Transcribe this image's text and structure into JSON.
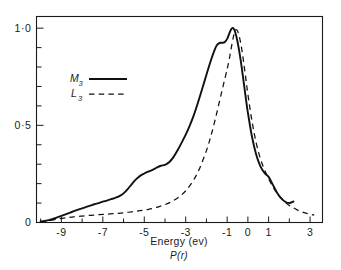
{
  "chart_data": {
    "type": "line",
    "title": "",
    "xlabel": "Energy (ev)",
    "ylabel": "",
    "xlim": [
      -10.2,
      3.6
    ],
    "ylim": [
      0,
      1.06
    ],
    "grid": false,
    "legend_position": "upper-left-inside",
    "x_tick_labels": [
      "-9",
      "-7",
      "-5",
      "-3",
      "-1",
      "0",
      "1",
      "3"
    ],
    "x_tick_values": [
      -9,
      -7,
      -5,
      -3,
      -1,
      0,
      1,
      3
    ],
    "x_minor_ticks": [
      -10,
      -9,
      -8,
      -7,
      -6,
      -5,
      -4,
      -3,
      -2,
      -1,
      0,
      1,
      2,
      3
    ],
    "y_tick_labels": [
      "0",
      "0·5",
      "1·0"
    ],
    "y_tick_values": [
      0,
      0.5,
      1.0
    ],
    "y_minor_ticks": [
      0,
      0.1,
      0.2,
      0.3,
      0.4,
      0.5,
      0.6,
      0.7,
      0.8,
      0.9,
      1.0
    ],
    "caption": "P(r)",
    "series": [
      {
        "name": "M3",
        "label": "M",
        "label_sub": "3",
        "style": "solid",
        "color": "#111111",
        "x": [
          -10.0,
          -9.8,
          -9.6,
          -9.4,
          -9.2,
          -9.0,
          -8.8,
          -8.6,
          -8.4,
          -8.2,
          -8.0,
          -7.8,
          -7.6,
          -7.4,
          -7.2,
          -7.0,
          -6.8,
          -6.6,
          -6.4,
          -6.2,
          -6.0,
          -5.8,
          -5.6,
          -5.4,
          -5.2,
          -5.0,
          -4.8,
          -4.6,
          -4.4,
          -4.2,
          -4.0,
          -3.8,
          -3.6,
          -3.4,
          -3.2,
          -3.0,
          -2.8,
          -2.6,
          -2.4,
          -2.2,
          -2.0,
          -1.8,
          -1.6,
          -1.5,
          -1.4,
          -1.3,
          -1.2,
          -1.1,
          -1.0,
          -0.9,
          -0.8,
          -0.7,
          -0.6,
          -0.5,
          -0.4,
          -0.3,
          -0.2,
          -0.1,
          0.0,
          0.2,
          0.4,
          0.6,
          0.8,
          1.0,
          1.2,
          1.4,
          1.6,
          1.8,
          2.0,
          2.2
        ],
        "y": [
          0.005,
          0.008,
          0.012,
          0.018,
          0.026,
          0.034,
          0.042,
          0.05,
          0.058,
          0.066,
          0.073,
          0.08,
          0.087,
          0.094,
          0.1,
          0.107,
          0.113,
          0.12,
          0.127,
          0.136,
          0.15,
          0.172,
          0.198,
          0.222,
          0.24,
          0.252,
          0.262,
          0.271,
          0.282,
          0.292,
          0.297,
          0.31,
          0.335,
          0.37,
          0.41,
          0.452,
          0.5,
          0.555,
          0.62,
          0.69,
          0.76,
          0.83,
          0.89,
          0.912,
          0.922,
          0.925,
          0.925,
          0.93,
          0.945,
          0.972,
          0.995,
          1.0,
          0.975,
          0.93,
          0.87,
          0.8,
          0.72,
          0.64,
          0.565,
          0.44,
          0.35,
          0.29,
          0.255,
          0.235,
          0.195,
          0.155,
          0.125,
          0.107,
          0.1,
          0.108
        ]
      },
      {
        "name": "L3",
        "label": "L",
        "label_sub": "3",
        "style": "dashed",
        "color": "#111111",
        "x": [
          -10.0,
          -9.6,
          -9.2,
          -8.8,
          -8.4,
          -8.0,
          -7.6,
          -7.2,
          -6.8,
          -6.4,
          -6.0,
          -5.6,
          -5.2,
          -4.8,
          -4.4,
          -4.0,
          -3.6,
          -3.2,
          -2.8,
          -2.4,
          -2.0,
          -1.8,
          -1.6,
          -1.4,
          -1.2,
          -1.0,
          -0.9,
          -0.8,
          -0.7,
          -0.6,
          -0.5,
          -0.4,
          -0.3,
          -0.2,
          -0.1,
          0.0,
          0.2,
          0.4,
          0.6,
          0.8,
          1.0,
          1.2,
          1.4,
          1.6,
          1.8,
          2.0,
          2.2,
          2.4,
          2.6,
          2.8,
          3.0,
          3.2
        ],
        "y": [
          0.004,
          0.01,
          0.018,
          0.024,
          0.029,
          0.033,
          0.037,
          0.04,
          0.043,
          0.046,
          0.05,
          0.055,
          0.061,
          0.068,
          0.078,
          0.092,
          0.112,
          0.142,
          0.19,
          0.262,
          0.37,
          0.44,
          0.52,
          0.61,
          0.7,
          0.79,
          0.84,
          0.9,
          0.955,
          0.99,
          0.985,
          0.95,
          0.895,
          0.82,
          0.74,
          0.66,
          0.52,
          0.41,
          0.33,
          0.272,
          0.225,
          0.185,
          0.152,
          0.125,
          0.104,
          0.088,
          0.075,
          0.064,
          0.055,
          0.048,
          0.042,
          0.038
        ]
      }
    ]
  },
  "legend": {
    "items": [
      {
        "label": "M",
        "sub": "3",
        "style": "solid"
      },
      {
        "label": "L",
        "sub": "3",
        "style": "dashed"
      }
    ]
  },
  "axis": {
    "x_title": "Energy (ev)",
    "caption": "P(r)"
  }
}
